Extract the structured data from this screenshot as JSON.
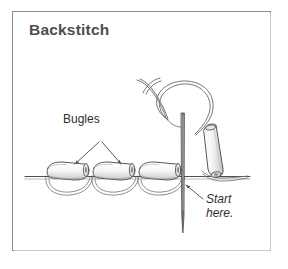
{
  "figure": {
    "title": "Backstitch",
    "background_color": "#ffffff",
    "frame_color": "#8d8d8d",
    "ink_color": "#555555",
    "text_color": "#2f2f2f",
    "title_color": "#4d4d4d"
  },
  "labels": {
    "bugles": "Bugles",
    "start_line1": "Start",
    "start_line2": "here."
  },
  "diagram_data": {
    "type": "instructional-line-art",
    "subject": "Backstitch bead embroidery technique",
    "elements": [
      {
        "name": "fabric-line",
        "description": "horizontal fabric/thread baseline",
        "x_start": 25,
        "x_end": 250,
        "y": 176
      },
      {
        "name": "bugle-bead",
        "description": "cylindrical bugle bead resting on fabric line",
        "count": 3,
        "positions": [
          {
            "cx": 67,
            "cy": 170
          },
          {
            "cx": 113,
            "cy": 170
          },
          {
            "cx": 159,
            "cy": 170
          }
        ]
      },
      {
        "name": "thread-loop-under-fabric",
        "description": "scalloped backstitch thread loops dipping below the fabric line",
        "count": 3
      },
      {
        "name": "needle",
        "description": "sewing needle inserted vertically through fabric, point below",
        "x": 183,
        "y_top": 113,
        "y_bottom": 233
      },
      {
        "name": "working-thread",
        "description": "thread forming a large open loop above the fabric, tail forking at upper left"
      },
      {
        "name": "threaded-bugle-bead",
        "description": "fourth bugle bead strung on the working thread, tilted",
        "cx": 213,
        "cy": 152
      },
      {
        "name": "bugles-pointer",
        "description": "inverted-V double arrow from Bugles label to two beads"
      },
      {
        "name": "start-here-arrow",
        "description": "arrow from Start here. label pointing up-left to needle entry point"
      }
    ]
  }
}
